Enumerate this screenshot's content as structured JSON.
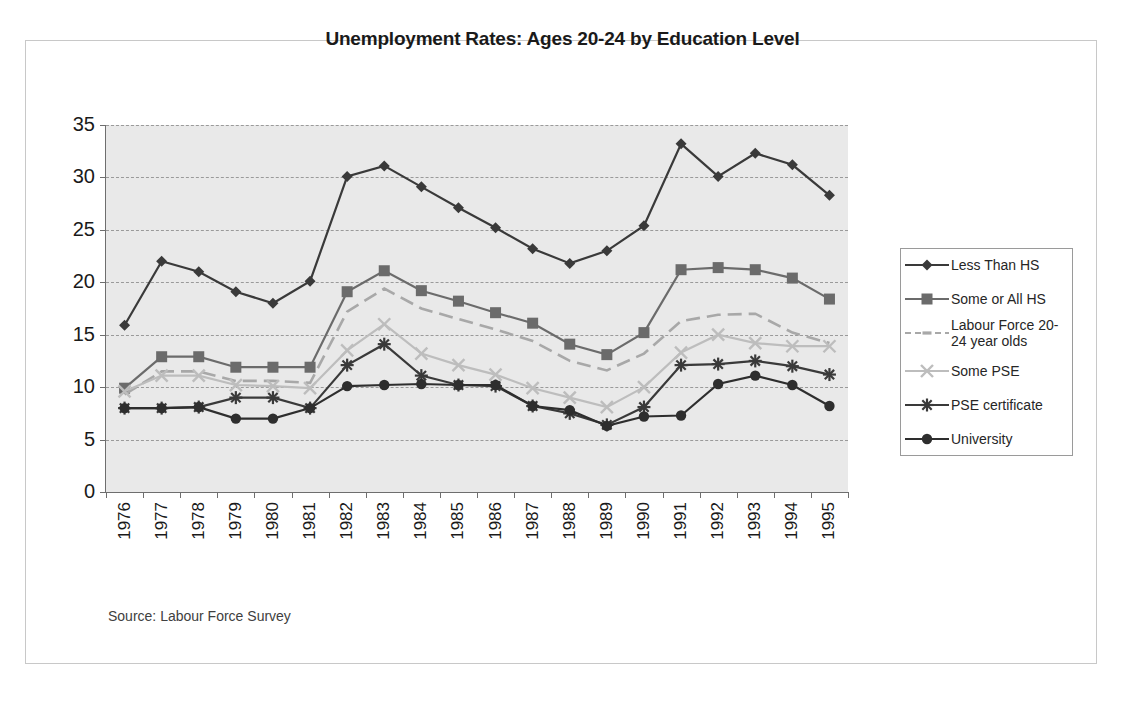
{
  "figure": {
    "source_note": "Source:  Labour Force Survey"
  },
  "chart_data": {
    "type": "line",
    "title": "Unemployment Rates: Ages 20-24 by Education Level",
    "xlabel": "",
    "ylabel": "",
    "ylim": [
      0,
      35
    ],
    "ytick_step": 5,
    "yticks": [
      "35",
      "30",
      "25",
      "20",
      "15",
      "10",
      "5",
      "0"
    ],
    "grid": true,
    "legend_position": "right",
    "categories": [
      "1976",
      "1977",
      "1978",
      "1979",
      "1980",
      "1981",
      "1982",
      "1983",
      "1984",
      "1985",
      "1986",
      "1987",
      "1988",
      "1989",
      "1990",
      "1991",
      "1992",
      "1993",
      "1994",
      "1995"
    ],
    "series": [
      {
        "name": "Less Than HS",
        "marker": "diamond",
        "color": "#3a3a3a",
        "dash": "solid",
        "values": [
          15.9,
          22.0,
          21.0,
          19.1,
          18.0,
          20.1,
          30.1,
          31.1,
          29.1,
          27.1,
          25.2,
          23.2,
          21.8,
          23.0,
          25.4,
          33.2,
          30.1,
          32.3,
          31.2,
          28.3
        ]
      },
      {
        "name": "Some or All HS",
        "marker": "square",
        "color": "#6b6b6b",
        "dash": "solid",
        "values": [
          9.9,
          12.9,
          12.9,
          11.9,
          11.9,
          11.9,
          19.1,
          21.1,
          19.2,
          18.2,
          17.1,
          16.1,
          14.1,
          13.1,
          15.2,
          21.2,
          21.4,
          21.2,
          20.4,
          18.4
        ]
      },
      {
        "name": "Labour Force 20-\n24 year olds",
        "marker": "dash-tri",
        "color": "#a8a8a8",
        "dash": "dashed",
        "values": [
          9.3,
          11.5,
          11.5,
          10.6,
          10.6,
          10.4,
          17.2,
          19.4,
          17.5,
          16.5,
          15.5,
          14.4,
          12.5,
          11.6,
          13.2,
          16.3,
          16.9,
          17.0,
          15.2,
          14.2
        ]
      },
      {
        "name": "Some PSE",
        "marker": "x",
        "color": "#bdbdbd",
        "dash": "solid",
        "values": [
          9.6,
          11.1,
          11.1,
          10.2,
          10.1,
          9.9,
          13.5,
          16.0,
          13.2,
          12.1,
          11.2,
          9.9,
          9.0,
          8.1,
          10.0,
          13.3,
          15.0,
          14.2,
          13.9,
          13.9
        ]
      },
      {
        "name": "PSE certificate",
        "marker": "asterisk",
        "color": "#3a3a3a",
        "dash": "solid",
        "values": [
          8.0,
          8.0,
          8.1,
          9.0,
          9.0,
          8.0,
          12.1,
          14.1,
          11.1,
          10.2,
          10.1,
          8.2,
          7.5,
          6.4,
          8.1,
          12.1,
          12.2,
          12.5,
          12.0,
          11.2
        ]
      },
      {
        "name": "University",
        "marker": "circle",
        "color": "#2e2e2e",
        "dash": "solid",
        "values": [
          8.0,
          8.0,
          8.1,
          7.0,
          7.0,
          8.0,
          10.1,
          10.2,
          10.3,
          10.2,
          10.2,
          8.2,
          7.8,
          6.3,
          7.2,
          7.3,
          10.3,
          11.1,
          10.2,
          8.2
        ]
      }
    ]
  }
}
